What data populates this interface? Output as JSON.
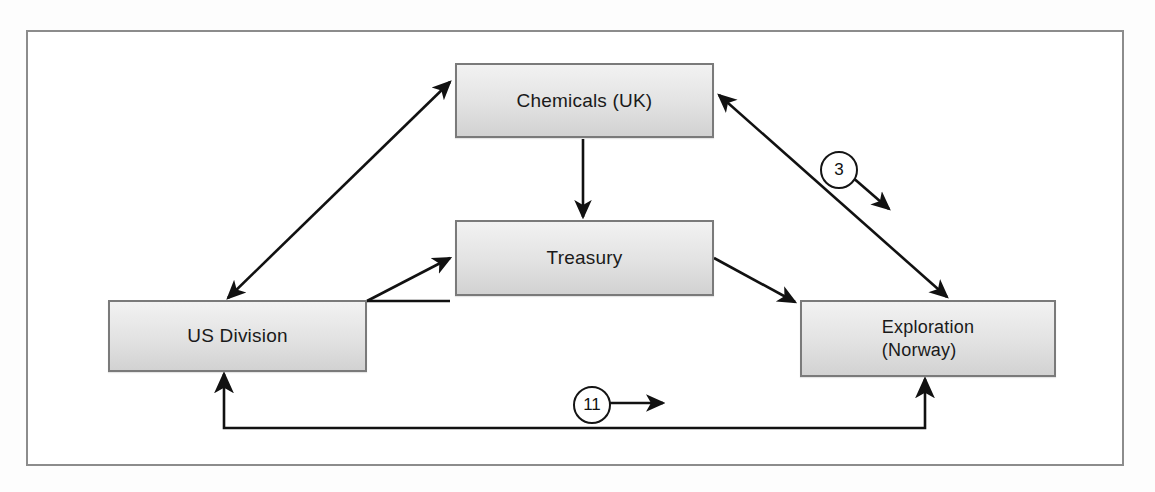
{
  "diagram": {
    "frame": {
      "border_color": "#8c8c8c"
    },
    "nodes": [
      {
        "id": "chemicals",
        "label": "Chemicals (UK)"
      },
      {
        "id": "treasury",
        "label": "Treasury"
      },
      {
        "id": "usdiv",
        "label": "US Division"
      },
      {
        "id": "explore",
        "label": "Exploration\n(Norway)"
      }
    ],
    "edges": [
      {
        "id": "usdiv-chemicals",
        "from": "US Division",
        "to": "Chemicals (UK)",
        "arrow": "double",
        "label": ""
      },
      {
        "id": "chemicals-treasury",
        "from": "Chemicals (UK)",
        "to": "Treasury",
        "arrow": "single",
        "label": ""
      },
      {
        "id": "usdiv-treasury",
        "from": "US Division",
        "to": "Treasury",
        "arrow": "single",
        "label": ""
      },
      {
        "id": "treasury-explore",
        "from": "Treasury",
        "to": "Exploration (Norway)",
        "arrow": "single",
        "label": ""
      },
      {
        "id": "chemicals-explore",
        "from": "Chemicals (UK)",
        "to": "Exploration (Norway)",
        "arrow": "double",
        "label": "3"
      },
      {
        "id": "explore-usdiv",
        "from": "Exploration (Norway)",
        "to": "US Division",
        "arrow": "double",
        "label": "11"
      }
    ],
    "badges": [
      {
        "id": "badge-3",
        "value": "3",
        "marker": "arrow-down-right"
      },
      {
        "id": "badge-11",
        "value": "11",
        "marker": "arrow-right"
      }
    ],
    "colors": {
      "node_fill_light": "#f2f2f2",
      "node_fill_dark": "#d2d2d2",
      "node_border": "#7a7a7a",
      "line": "#111111",
      "frame_border": "#8c8c8c",
      "background": "#ffffff"
    }
  }
}
